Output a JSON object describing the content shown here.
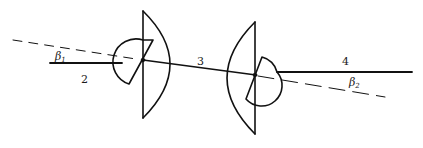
{
  "diagram": {
    "type": "mechanical linkage / universal joint schematic",
    "stroke_color": "#111111",
    "background": "#ffffff",
    "shafts": [
      {
        "id": "2",
        "label": "2"
      },
      {
        "id": "3",
        "label": "3"
      },
      {
        "id": "4",
        "label": "4"
      }
    ],
    "angles": [
      {
        "id": "beta1",
        "symbol": "β",
        "subscript": "1"
      },
      {
        "id": "beta2",
        "symbol": "β",
        "subscript": "2"
      }
    ],
    "joints": [
      {
        "id": "joint-left",
        "description": "left universal joint (yoke)"
      },
      {
        "id": "joint-right",
        "description": "right universal joint (yoke)"
      }
    ]
  }
}
